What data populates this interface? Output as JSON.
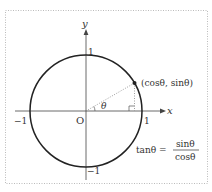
{
  "diagram": {
    "axes": {
      "x_label": "x",
      "y_label": "y",
      "origin_label": "O"
    },
    "ticks": {
      "x_pos": "1",
      "x_neg": "−1",
      "y_pos": "1",
      "y_neg": "−1"
    },
    "angle_label": "θ",
    "point_label": "(cosθ, sinθ)",
    "formula": {
      "lhs": "tanθ =",
      "numerator": "sinθ",
      "denominator": "cosθ"
    },
    "colors": {
      "stroke": "#222222",
      "text": "#333333",
      "border": "#bbbbbb",
      "dashed": "#888888"
    }
  }
}
